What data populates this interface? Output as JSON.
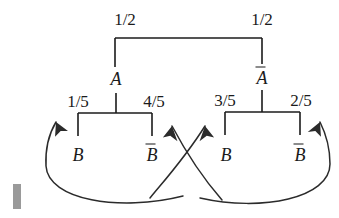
{
  "diagram": {
    "type": "probability-tree",
    "ink_color": "#1b1b1b",
    "background_color": "#ffffff",
    "levels": [
      {
        "level": 1,
        "branch_labels": [
          "1/2",
          "1/2"
        ],
        "nodes": [
          "A",
          "A-bar"
        ]
      },
      {
        "level": 2,
        "branch_labels": [
          "1/5",
          "4/5",
          "3/5",
          "2/5"
        ],
        "nodes": [
          "B",
          "B-bar",
          "B",
          "B-bar"
        ]
      }
    ]
  },
  "labels": {
    "top_left_prob": "1/2",
    "top_right_prob": "1/2",
    "node_a": "A",
    "node_a_bar": "A",
    "left_prob_1": "1/5",
    "left_prob_2": "4/5",
    "right_prob_1": "3/5",
    "right_prob_2": "2/5",
    "leaf_b_1": "B",
    "leaf_b_bar_1": "B",
    "leaf_b_2": "B",
    "leaf_b_bar_2": "B"
  },
  "annotations": {
    "arrow_count": 4,
    "arrow_description": "four curved arrows crossing in the centre, each pointing up toward a second-level branch probability",
    "scan_artifact": "gray vertical bar at lower-left margin"
  }
}
